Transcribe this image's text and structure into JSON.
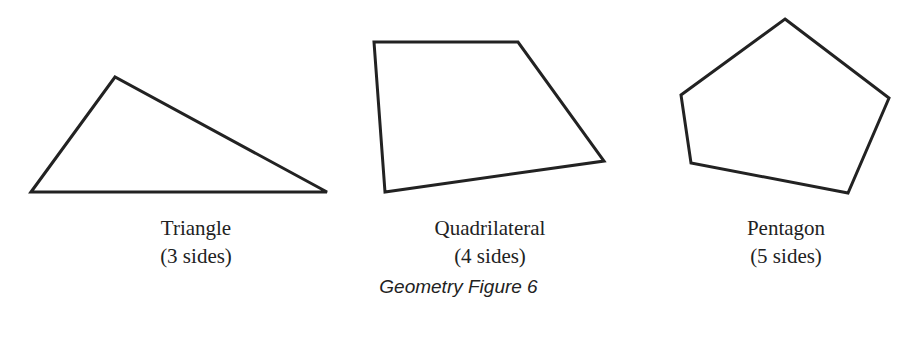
{
  "figure": {
    "caption": "Geometry Figure 6",
    "stroke_color": "#222222",
    "shapes": [
      {
        "name": "Triangle",
        "sides_label": "(3 sides)",
        "sides": 3,
        "points": "31,192 115,77 327,192"
      },
      {
        "name": "Quadrilateral",
        "sides_label": "(4 sides)",
        "sides": 4,
        "points": "374,42 518,42 604,161 385,192"
      },
      {
        "name": "Pentagon",
        "sides_label": "(5 sides)",
        "sides": 5,
        "points": "785,19 889,98 848,193 691,163 681,95"
      }
    ]
  }
}
